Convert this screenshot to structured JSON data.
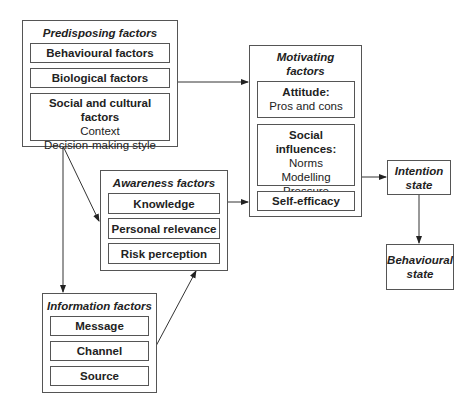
{
  "predisposing": {
    "title": "Predisposing factors",
    "items": [
      {
        "heading": "Behavioural factors"
      },
      {
        "heading": "Biological factors"
      },
      {
        "heading": "Social and cultural factors",
        "sub": [
          "Context",
          "Decision-making style"
        ]
      }
    ]
  },
  "motivating": {
    "title_line1": "Motivating",
    "title_line2": "factors",
    "items": [
      {
        "heading": "Attitude:",
        "sub": [
          "Pros and cons"
        ]
      },
      {
        "heading": "Social influences:",
        "sub": [
          "Norms",
          "Modelling",
          "Pressure"
        ]
      },
      {
        "heading": "Self-efficacy"
      }
    ]
  },
  "awareness": {
    "title": "Awareness factors",
    "items": [
      {
        "heading": "Knowledge"
      },
      {
        "heading": "Personal relevance"
      },
      {
        "heading": "Risk perception"
      }
    ]
  },
  "information": {
    "title": "Information factors",
    "items": [
      {
        "heading": "Message"
      },
      {
        "heading": "Channel"
      },
      {
        "heading": "Source"
      }
    ]
  },
  "intention": {
    "line1": "Intention",
    "line2": "state"
  },
  "behavioural": {
    "line1": "Behavioural",
    "line2": "state"
  }
}
